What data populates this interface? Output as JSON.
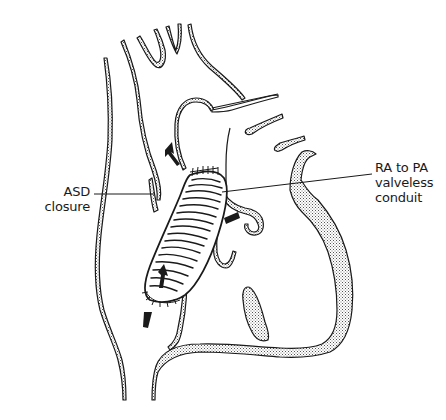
{
  "figure": {
    "type": "anatomical line drawing",
    "colors": {
      "line": "#1a1a1a",
      "stipple_fill": "#c8c8c8",
      "background": "#ffffff"
    }
  },
  "labels": {
    "asd_closure": {
      "line1": "ASD",
      "line2": "closure"
    },
    "conduit": {
      "line1": "RA to PA",
      "line2": "valveless",
      "line3": "conduit"
    }
  },
  "annotations": {
    "arrows": [
      {
        "name": "flow-arrow-upper",
        "direction": "up-left"
      },
      {
        "name": "flow-arrow-right",
        "direction": "left"
      },
      {
        "name": "flow-arrow-inner",
        "direction": "up"
      },
      {
        "name": "flow-arrow-bottom",
        "direction": "up"
      }
    ]
  }
}
